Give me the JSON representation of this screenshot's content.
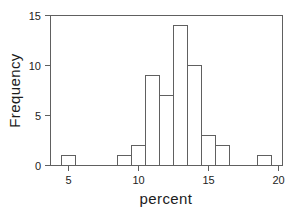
{
  "window": {
    "width_px": 293,
    "height_px": 211
  },
  "chart_data": {
    "type": "bar",
    "subtype": "histogram",
    "title": "",
    "xlabel": "percent",
    "ylabel": "Frequency",
    "categories": [
      5,
      9,
      10,
      11,
      12,
      13,
      14,
      15,
      16,
      19
    ],
    "values": [
      1,
      1,
      2,
      9,
      7,
      14,
      10,
      3,
      2,
      1
    ],
    "bin_width": 1,
    "total_count": 50,
    "x_ticks": [
      5,
      10,
      15,
      20
    ],
    "y_ticks": [
      0,
      5,
      10,
      15
    ],
    "xlim": [
      3.7,
      20.3
    ],
    "ylim": [
      0,
      15
    ],
    "grid": false,
    "legend": false,
    "bar_fill": "#ffffff",
    "line_color": "#606060",
    "text_color": "#222222",
    "background": "#ffffff"
  }
}
